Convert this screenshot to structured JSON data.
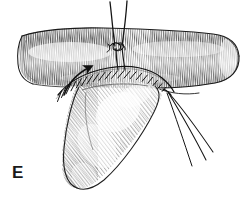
{
  "figure": {
    "panel_label": "E",
    "caption": "",
    "background_color": "#ffffff",
    "ink_color": "#1a1a1a",
    "hatch_color": "#555555",
    "style": "pen-and-ink line engraving"
  },
  "structures": {
    "tube": {
      "name": "tubular-conduit",
      "label": "",
      "shading": "vertical hatching",
      "open_end": "right",
      "cut_end": "left"
    },
    "flap": {
      "name": "tissue-flap",
      "label": "",
      "shading": "curved contour hatching",
      "orientation": "descending to lower left"
    },
    "suture_line": {
      "name": "anastomosis-suture-line",
      "label": "",
      "stitch_count": 16,
      "stitch_style": "interrupted"
    },
    "knot": {
      "name": "suture-knot",
      "label": "",
      "strand_count": 2
    },
    "free_threads": {
      "name": "free-suture-strands",
      "label": "",
      "strand_count": 3,
      "direction": "lower right"
    },
    "arrow": {
      "name": "direction-arrow",
      "label": "",
      "direction": "up-right",
      "meaning": "direction of suturing"
    }
  },
  "colors": {
    "ink": "#1a1a1a",
    "hatch_light": "#8c8c8c",
    "hatch_mid": "#5f5f5f",
    "hatch_dark": "#2b2b2b",
    "paper": "#ffffff"
  }
}
